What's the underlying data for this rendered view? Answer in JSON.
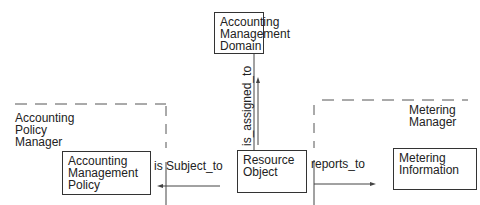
{
  "diagram": {
    "nodes": {
      "domain": {
        "label": "Accounting\nManagement\nDomain"
      },
      "resource": {
        "label": "Resource\nObject"
      },
      "policy": {
        "label": "Accounting\nManagement\nPolicy"
      },
      "metering_info": {
        "label": "Metering\nInformation"
      }
    },
    "groups": {
      "policy_manager": {
        "label": "Accounting\nPolicy\nManager"
      },
      "metering_manager": {
        "label": "Metering\nManager"
      }
    },
    "edges": {
      "assigned": {
        "label": "is_assigned_to"
      },
      "subject": {
        "label": "is Subject_to"
      },
      "reports": {
        "label": "reports_to"
      }
    }
  }
}
